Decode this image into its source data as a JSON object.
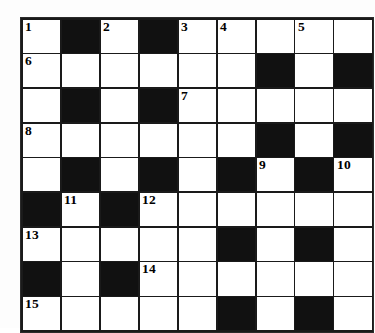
{
  "puzzle": {
    "title": "Crossword Grid",
    "type": "crossword",
    "columns": 9,
    "rows": 9,
    "colors": {
      "block": "#111111",
      "empty": "#ffffff",
      "grid_line": "#1a1a1a",
      "number_text": "#000000",
      "page_background": "#fdfdfd"
    },
    "numbers": {
      "n1": "1",
      "n2": "2",
      "n3": "3",
      "n4": "4",
      "n5": "5",
      "n6": "6",
      "n7": "7",
      "n8": "8",
      "n9": "9",
      "n10": "10",
      "n11": "11",
      "n12": "12",
      "n13": "13",
      "n14": "14",
      "n15": "15"
    },
    "grid": [
      [
        {
          "block": false,
          "number": "1",
          "letter": ""
        },
        {
          "block": true,
          "number": "",
          "letter": ""
        },
        {
          "block": false,
          "number": "2",
          "letter": ""
        },
        {
          "block": true,
          "number": "",
          "letter": ""
        },
        {
          "block": false,
          "number": "3",
          "letter": ""
        },
        {
          "block": false,
          "number": "4",
          "letter": ""
        },
        {
          "block": false,
          "number": "",
          "letter": ""
        },
        {
          "block": false,
          "number": "5",
          "letter": ""
        },
        {
          "block": false,
          "number": "",
          "letter": ""
        }
      ],
      [
        {
          "block": false,
          "number": "6",
          "letter": ""
        },
        {
          "block": false,
          "number": "",
          "letter": ""
        },
        {
          "block": false,
          "number": "",
          "letter": ""
        },
        {
          "block": false,
          "number": "",
          "letter": ""
        },
        {
          "block": false,
          "number": "",
          "letter": ""
        },
        {
          "block": false,
          "number": "",
          "letter": ""
        },
        {
          "block": true,
          "number": "",
          "letter": ""
        },
        {
          "block": false,
          "number": "",
          "letter": ""
        },
        {
          "block": true,
          "number": "",
          "letter": ""
        }
      ],
      [
        {
          "block": false,
          "number": "",
          "letter": ""
        },
        {
          "block": true,
          "number": "",
          "letter": ""
        },
        {
          "block": false,
          "number": "",
          "letter": ""
        },
        {
          "block": true,
          "number": "",
          "letter": ""
        },
        {
          "block": false,
          "number": "7",
          "letter": ""
        },
        {
          "block": false,
          "number": "",
          "letter": ""
        },
        {
          "block": false,
          "number": "",
          "letter": ""
        },
        {
          "block": false,
          "number": "",
          "letter": ""
        },
        {
          "block": false,
          "number": "",
          "letter": ""
        }
      ],
      [
        {
          "block": false,
          "number": "8",
          "letter": ""
        },
        {
          "block": false,
          "number": "",
          "letter": ""
        },
        {
          "block": false,
          "number": "",
          "letter": ""
        },
        {
          "block": false,
          "number": "",
          "letter": ""
        },
        {
          "block": false,
          "number": "",
          "letter": ""
        },
        {
          "block": false,
          "number": "",
          "letter": ""
        },
        {
          "block": true,
          "number": "",
          "letter": ""
        },
        {
          "block": false,
          "number": "",
          "letter": ""
        },
        {
          "block": true,
          "number": "",
          "letter": ""
        }
      ],
      [
        {
          "block": false,
          "number": "",
          "letter": ""
        },
        {
          "block": true,
          "number": "",
          "letter": ""
        },
        {
          "block": false,
          "number": "",
          "letter": ""
        },
        {
          "block": true,
          "number": "",
          "letter": ""
        },
        {
          "block": false,
          "number": "",
          "letter": ""
        },
        {
          "block": true,
          "number": "",
          "letter": ""
        },
        {
          "block": false,
          "number": "9",
          "letter": ""
        },
        {
          "block": true,
          "number": "",
          "letter": ""
        },
        {
          "block": false,
          "number": "10",
          "letter": ""
        }
      ],
      [
        {
          "block": true,
          "number": "",
          "letter": ""
        },
        {
          "block": false,
          "number": "11",
          "letter": ""
        },
        {
          "block": true,
          "number": "",
          "letter": ""
        },
        {
          "block": false,
          "number": "12",
          "letter": ""
        },
        {
          "block": false,
          "number": "",
          "letter": ""
        },
        {
          "block": false,
          "number": "",
          "letter": ""
        },
        {
          "block": false,
          "number": "",
          "letter": ""
        },
        {
          "block": false,
          "number": "",
          "letter": ""
        },
        {
          "block": false,
          "number": "",
          "letter": ""
        }
      ],
      [
        {
          "block": false,
          "number": "13",
          "letter": ""
        },
        {
          "block": false,
          "number": "",
          "letter": ""
        },
        {
          "block": false,
          "number": "",
          "letter": ""
        },
        {
          "block": false,
          "number": "",
          "letter": ""
        },
        {
          "block": false,
          "number": "",
          "letter": ""
        },
        {
          "block": true,
          "number": "",
          "letter": ""
        },
        {
          "block": false,
          "number": "",
          "letter": ""
        },
        {
          "block": true,
          "number": "",
          "letter": ""
        },
        {
          "block": false,
          "number": "",
          "letter": ""
        }
      ],
      [
        {
          "block": true,
          "number": "",
          "letter": ""
        },
        {
          "block": false,
          "number": "",
          "letter": ""
        },
        {
          "block": true,
          "number": "",
          "letter": ""
        },
        {
          "block": false,
          "number": "14",
          "letter": ""
        },
        {
          "block": false,
          "number": "",
          "letter": ""
        },
        {
          "block": false,
          "number": "",
          "letter": ""
        },
        {
          "block": false,
          "number": "",
          "letter": ""
        },
        {
          "block": false,
          "number": "",
          "letter": ""
        },
        {
          "block": false,
          "number": "",
          "letter": ""
        }
      ],
      [
        {
          "block": false,
          "number": "15",
          "letter": ""
        },
        {
          "block": false,
          "number": "",
          "letter": ""
        },
        {
          "block": false,
          "number": "",
          "letter": ""
        },
        {
          "block": false,
          "number": "",
          "letter": ""
        },
        {
          "block": false,
          "number": "",
          "letter": ""
        },
        {
          "block": true,
          "number": "",
          "letter": ""
        },
        {
          "block": false,
          "number": "",
          "letter": ""
        },
        {
          "block": true,
          "number": "",
          "letter": ""
        },
        {
          "block": false,
          "number": "",
          "letter": ""
        }
      ]
    ]
  }
}
